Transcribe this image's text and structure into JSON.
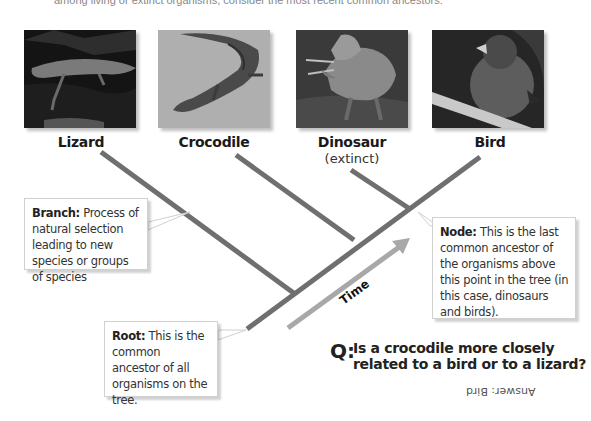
{
  "intro_text": "among living or extinct organisms, consider the most recent common ancestors.",
  "organisms": [
    {
      "name": "Lizard",
      "note": ""
    },
    {
      "name": "Crocodile",
      "note": ""
    },
    {
      "name": "Dinosaur",
      "note": "(extinct)"
    },
    {
      "name": "Bird",
      "note": ""
    }
  ],
  "callouts": {
    "branch": {
      "term": "Branch:",
      "text": " Process of natural selection leading to new species or groups of species"
    },
    "node": {
      "term": "Node:",
      "text": " This is the last common ancestor of the organisms above this point in the tree (in this case, dinosaurs and birds)."
    },
    "root": {
      "term": "Root:",
      "text": " This is the common ancestor of all organisms on the tree."
    }
  },
  "time_label": "Time",
  "question": {
    "prefix": "Q:",
    "text": "Is a crocodile more closely related to a bird or to a lizard?"
  },
  "answer": "Answer: Bird",
  "colors": {
    "branch_line": "#6f6f6f",
    "time_arrow": "#a8a8a8",
    "callout_border": "#d0d0d0"
  }
}
